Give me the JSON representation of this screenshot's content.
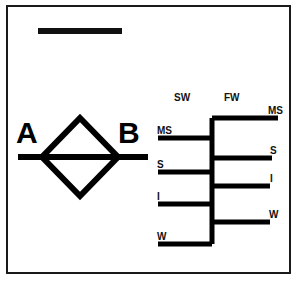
{
  "figure": {
    "scale_bar": "",
    "left_panel": {
      "shape": "diamond",
      "label_left": "A",
      "label_right": "B"
    },
    "tree_panel": {
      "headers": {
        "left": "SW",
        "right": "FW"
      },
      "left_leaves": [
        {
          "label": "MS"
        },
        {
          "label": "S"
        },
        {
          "label": "I"
        },
        {
          "label": "W"
        }
      ],
      "right_leaves": [
        {
          "label": "MS"
        },
        {
          "label": "S"
        },
        {
          "label": "I"
        },
        {
          "label": "W"
        }
      ]
    }
  },
  "colors": {
    "ink": "#111111",
    "frame": "#1a1a1a",
    "paper": "#ffffff"
  }
}
